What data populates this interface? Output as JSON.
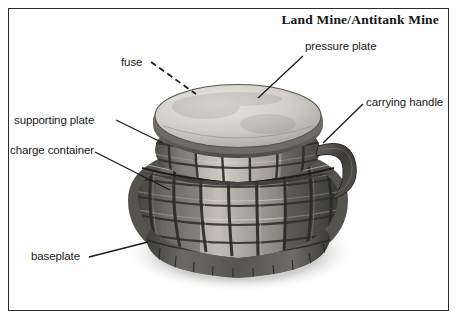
{
  "diagram": {
    "title": "Land Mine/Antitank Mine",
    "view": "three-quarter perspective pencil illustration, grayscale",
    "border_color": "#2b2b2b",
    "background_color": "#ffffff",
    "ink_color": "#1b1b1b"
  },
  "labels": [
    {
      "id": "pressure-plate",
      "text": "pressure plate",
      "side": "right",
      "leader": "solid"
    },
    {
      "id": "fuse",
      "text": "fuse",
      "side": "left",
      "leader": "dashed"
    },
    {
      "id": "carrying-handle",
      "text": "carrying handle",
      "side": "right",
      "leader": "solid"
    },
    {
      "id": "supporting-plate",
      "text": "supporting plate",
      "side": "left",
      "leader": "solid"
    },
    {
      "id": "charge-container",
      "text": "charge container",
      "side": "left",
      "leader": "solid"
    },
    {
      "id": "baseplate",
      "text": "baseplate",
      "side": "left",
      "leader": "solid"
    }
  ],
  "palette": {
    "plate_light": "#d8d6d0",
    "plate_mid": "#b3b0a9",
    "body_dark": "#4a4944",
    "body_mid": "#7d7b74",
    "body_light": "#c9c6be",
    "shadow": "#33322e",
    "handle": "#3e3d39"
  }
}
